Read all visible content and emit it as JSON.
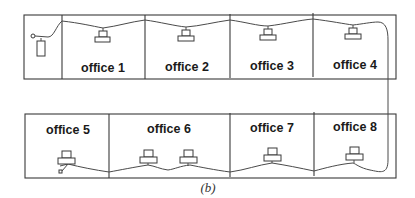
{
  "diagram": {
    "caption": "(b)",
    "colors": {
      "line": "#3a3a3a",
      "text": "#1a1a1a",
      "background": "#ffffff"
    },
    "top_row": {
      "server_room": {
        "label": "",
        "device": "terminator-and-server"
      },
      "offices": [
        {
          "label": "office 1",
          "computers": 1
        },
        {
          "label": "office 2",
          "computers": 1
        },
        {
          "label": "office 3",
          "computers": 1
        },
        {
          "label": "office 4",
          "computers": 1
        }
      ]
    },
    "bottom_row": {
      "offices": [
        {
          "label": "office 5",
          "computers": 1
        },
        {
          "label": "office 6",
          "computers": 2
        },
        {
          "label": "office 7",
          "computers": 1
        },
        {
          "label": "office 8",
          "computers": 1
        }
      ]
    }
  }
}
